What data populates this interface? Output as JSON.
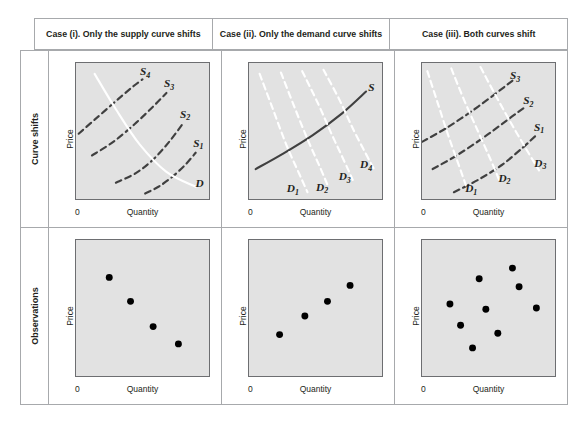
{
  "figure": {
    "title_caption": "",
    "colors": {
      "plot_fill": "#e2e2e2",
      "plot_border": "#6d6e71",
      "grid_border": "#a7a9ac",
      "supply_dark": "#404040",
      "demand_white": "#ffffff",
      "dot": "#000000",
      "text": "#231f20"
    }
  },
  "headers": [
    {
      "label": "Case (i). Only the supply curve shifts"
    },
    {
      "label": "Case (ii). Only the demand curve shifts"
    },
    {
      "label": "Case (iii). Both curves shift"
    }
  ],
  "rows": [
    {
      "label": "Curve shifts"
    },
    {
      "label": "Observations"
    }
  ],
  "axes": {
    "x_zero": "0",
    "x_label": "Quantity",
    "y_label": "Price"
  },
  "chart_data": [
    {
      "id": "case1-curves",
      "type": "line",
      "title": "Case (i). Only the supply curve shifts",
      "xlabel": "Quantity",
      "ylabel": "Price",
      "xlim": [
        0,
        100
      ],
      "ylim": [
        0,
        100
      ],
      "grid": false,
      "legend": "inline-labels",
      "series": [
        {
          "name": "S1",
          "style": "dashed",
          "color": "#404040",
          "points": [
            [
              52,
              4
            ],
            [
              62,
              9
            ],
            [
              72,
              16
            ],
            [
              82,
              25
            ],
            [
              90,
              34
            ]
          ]
        },
        {
          "name": "S2",
          "style": "dashed",
          "color": "#404040",
          "points": [
            [
              30,
              12
            ],
            [
              45,
              19
            ],
            [
              58,
              29
            ],
            [
              70,
              42
            ],
            [
              80,
              55
            ]
          ]
        },
        {
          "name": "S3",
          "style": "dashed",
          "color": "#404040",
          "points": [
            [
              12,
              32
            ],
            [
              28,
              42
            ],
            [
              44,
              55
            ],
            [
              58,
              68
            ],
            [
              68,
              78
            ]
          ]
        },
        {
          "name": "S4",
          "style": "dashed",
          "color": "#404040",
          "points": [
            [
              2,
              48
            ],
            [
              16,
              60
            ],
            [
              30,
              72
            ],
            [
              42,
              82
            ],
            [
              50,
              88
            ]
          ]
        },
        {
          "name": "D",
          "style": "solid",
          "color": "#ffffff",
          "points": [
            [
              14,
              92
            ],
            [
              30,
              66
            ],
            [
              48,
              40
            ],
            [
              68,
              20
            ],
            [
              90,
              9
            ]
          ]
        }
      ],
      "labels": [
        {
          "text": "S",
          "sub": "1",
          "x": 92,
          "y": 38
        },
        {
          "text": "S",
          "sub": "2",
          "x": 82,
          "y": 60
        },
        {
          "text": "S",
          "sub": "3",
          "x": 70,
          "y": 83
        },
        {
          "text": "S",
          "sub": "4",
          "x": 52,
          "y": 92
        },
        {
          "text": "D",
          "sub": "",
          "x": 93,
          "y": 8
        }
      ]
    },
    {
      "id": "case2-curves",
      "type": "line",
      "title": "Case (ii). Only the demand curve shifts",
      "xlabel": "Quantity",
      "ylabel": "Price",
      "xlim": [
        0,
        100
      ],
      "ylim": [
        0,
        100
      ],
      "grid": false,
      "legend": "inline-labels",
      "series": [
        {
          "name": "S",
          "style": "solid",
          "color": "#404040",
          "points": [
            [
              5,
              22
            ],
            [
              25,
              33
            ],
            [
              48,
              47
            ],
            [
              70,
              63
            ],
            [
              88,
              79
            ]
          ]
        },
        {
          "name": "D1",
          "style": "dashed",
          "color": "#ffffff",
          "points": [
            [
              8,
              92
            ],
            [
              18,
              66
            ],
            [
              28,
              40
            ],
            [
              38,
              18
            ],
            [
              44,
              5
            ]
          ]
        },
        {
          "name": "D2",
          "style": "dashed",
          "color": "#ffffff",
          "points": [
            [
              24,
              93
            ],
            [
              34,
              68
            ],
            [
              44,
              44
            ],
            [
              54,
              22
            ],
            [
              60,
              8
            ]
          ]
        },
        {
          "name": "D3",
          "style": "dashed",
          "color": "#ffffff",
          "points": [
            [
              40,
              94
            ],
            [
              52,
              70
            ],
            [
              62,
              48
            ],
            [
              72,
              27
            ],
            [
              78,
              14
            ]
          ]
        },
        {
          "name": "D4",
          "style": "dashed",
          "color": "#ffffff",
          "points": [
            [
              56,
              95
            ],
            [
              68,
              73
            ],
            [
              78,
              52
            ],
            [
              88,
              33
            ],
            [
              94,
              22
            ]
          ]
        }
      ],
      "labels": [
        {
          "text": "S",
          "sub": "",
          "x": 92,
          "y": 80
        },
        {
          "text": "D",
          "sub": "4",
          "x": 88,
          "y": 22
        },
        {
          "text": "D",
          "sub": "3",
          "x": 72,
          "y": 13
        },
        {
          "text": "D",
          "sub": "2",
          "x": 55,
          "y": 5
        },
        {
          "text": "D",
          "sub": "1",
          "x": 33,
          "y": 4
        }
      ]
    },
    {
      "id": "case3-curves",
      "type": "line",
      "title": "Case (iii). Both curves shift",
      "xlabel": "Quantity",
      "ylabel": "Price",
      "xlim": [
        0,
        100
      ],
      "ylim": [
        0,
        100
      ],
      "grid": false,
      "legend": "inline-labels",
      "series": [
        {
          "name": "S1",
          "style": "dashed",
          "color": "#404040",
          "points": [
            [
              24,
              5
            ],
            [
              42,
              14
            ],
            [
              60,
              25
            ],
            [
              76,
              38
            ],
            [
              86,
              47
            ]
          ]
        },
        {
          "name": "S2",
          "style": "dashed",
          "color": "#404040",
          "points": [
            [
              8,
              22
            ],
            [
              26,
              32
            ],
            [
              46,
              45
            ],
            [
              64,
              58
            ],
            [
              78,
              68
            ]
          ]
        },
        {
          "name": "S3",
          "style": "dashed",
          "color": "#404040",
          "points": [
            [
              0,
              42
            ],
            [
              18,
              52
            ],
            [
              38,
              65
            ],
            [
              56,
              78
            ],
            [
              68,
              87
            ]
          ]
        },
        {
          "name": "D1",
          "style": "dashed",
          "color": "#ffffff",
          "points": [
            [
              4,
              94
            ],
            [
              12,
              70
            ],
            [
              20,
              46
            ],
            [
              28,
              24
            ],
            [
              33,
              10
            ]
          ]
        },
        {
          "name": "D2",
          "style": "dashed",
          "color": "#ffffff",
          "points": [
            [
              22,
              96
            ],
            [
              32,
              72
            ],
            [
              42,
              50
            ],
            [
              52,
              28
            ],
            [
              58,
              14
            ]
          ]
        },
        {
          "name": "D3",
          "style": "dashed",
          "color": "#ffffff",
          "points": [
            [
              44,
              97
            ],
            [
              56,
              75
            ],
            [
              68,
              54
            ],
            [
              80,
              34
            ],
            [
              88,
              21
            ]
          ]
        }
      ],
      "labels": [
        {
          "text": "S",
          "sub": "1",
          "x": 88,
          "y": 50
        },
        {
          "text": "S",
          "sub": "2",
          "x": 80,
          "y": 70
        },
        {
          "text": "S",
          "sub": "3",
          "x": 70,
          "y": 89
        },
        {
          "text": "D",
          "sub": "3",
          "x": 89,
          "y": 23
        },
        {
          "text": "D",
          "sub": "2",
          "x": 62,
          "y": 12
        },
        {
          "text": "D",
          "sub": "1",
          "x": 37,
          "y": 4
        }
      ]
    },
    {
      "id": "case1-observations",
      "type": "scatter",
      "title": "Case (i). Observations",
      "xlabel": "Quantity",
      "ylabel": "Price",
      "xlim": [
        0,
        100
      ],
      "ylim": [
        0,
        100
      ],
      "grid": false,
      "points": [
        [
          25,
          73
        ],
        [
          41,
          55
        ],
        [
          58,
          36
        ],
        [
          77,
          23
        ]
      ]
    },
    {
      "id": "case2-observations",
      "type": "scatter",
      "title": "Case (ii). Observations",
      "xlabel": "Quantity",
      "ylabel": "Price",
      "xlim": [
        0,
        100
      ],
      "ylim": [
        0,
        100
      ],
      "grid": false,
      "points": [
        [
          23,
          30
        ],
        [
          42,
          44
        ],
        [
          59,
          55
        ],
        [
          76,
          67
        ]
      ]
    },
    {
      "id": "case3-observations",
      "type": "scatter",
      "title": "Case (iii). Observations",
      "xlabel": "Quantity",
      "ylabel": "Price",
      "xlim": [
        0,
        100
      ],
      "ylim": [
        0,
        100
      ],
      "grid": false,
      "points": [
        [
          21,
          53
        ],
        [
          29,
          37
        ],
        [
          38,
          20
        ],
        [
          43,
          72
        ],
        [
          48,
          49
        ],
        [
          57,
          31
        ],
        [
          68,
          80
        ],
        [
          73,
          66
        ],
        [
          86,
          50
        ]
      ]
    }
  ]
}
